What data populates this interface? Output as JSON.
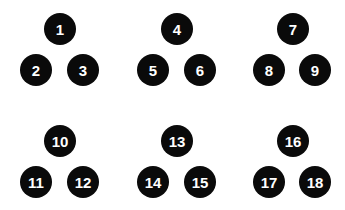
{
  "colors": {
    "node_fill": "#0a0a0a",
    "node_text": "#ffffff",
    "background": "#ffffff"
  },
  "groups": [
    {
      "nodes": [
        {
          "label": "1",
          "x": 60,
          "y": 29
        },
        {
          "label": "2",
          "x": 36,
          "y": 70
        },
        {
          "label": "3",
          "x": 83,
          "y": 70
        }
      ]
    },
    {
      "nodes": [
        {
          "label": "4",
          "x": 177,
          "y": 29
        },
        {
          "label": "5",
          "x": 153,
          "y": 70
        },
        {
          "label": "6",
          "x": 200,
          "y": 70
        }
      ]
    },
    {
      "nodes": [
        {
          "label": "7",
          "x": 293,
          "y": 29
        },
        {
          "label": "8",
          "x": 269,
          "y": 70
        },
        {
          "label": "9",
          "x": 315,
          "y": 70
        }
      ]
    },
    {
      "nodes": [
        {
          "label": "10",
          "x": 60,
          "y": 141
        },
        {
          "label": "11",
          "x": 36,
          "y": 182
        },
        {
          "label": "12",
          "x": 83,
          "y": 182
        }
      ]
    },
    {
      "nodes": [
        {
          "label": "13",
          "x": 177,
          "y": 141
        },
        {
          "label": "14",
          "x": 153,
          "y": 182
        },
        {
          "label": "15",
          "x": 200,
          "y": 182
        }
      ]
    },
    {
      "nodes": [
        {
          "label": "16",
          "x": 293,
          "y": 141
        },
        {
          "label": "17",
          "x": 269,
          "y": 182
        },
        {
          "label": "18",
          "x": 315,
          "y": 182
        }
      ]
    }
  ]
}
